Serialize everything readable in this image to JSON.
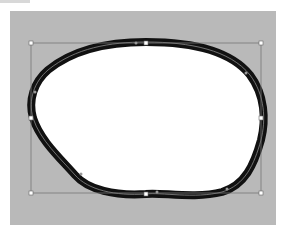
{
  "canvas": {
    "background_color": "#b9b9b9",
    "artboard": "vector-shape-editor"
  },
  "shape": {
    "type": "closed-blob-path",
    "fill": "#ffffff",
    "stroke": "#111111",
    "stroke_width": 8,
    "selected": true
  },
  "bounding_box": {
    "x": 31,
    "y": 43,
    "width": 230,
    "height": 150,
    "stroke": "#777777",
    "handles": [
      {
        "name": "top-left",
        "x": 31,
        "y": 43
      },
      {
        "name": "top-center",
        "x": 146,
        "y": 43
      },
      {
        "name": "top-right",
        "x": 261,
        "y": 43
      },
      {
        "name": "middle-left",
        "x": 31,
        "y": 118
      },
      {
        "name": "middle-right",
        "x": 261,
        "y": 118
      },
      {
        "name": "bottom-left",
        "x": 31,
        "y": 193
      },
      {
        "name": "bottom-center",
        "x": 146,
        "y": 194
      },
      {
        "name": "bottom-right",
        "x": 261,
        "y": 193
      }
    ]
  },
  "anchor_points": [
    {
      "x": 136,
      "y": 43
    },
    {
      "x": 246,
      "y": 73
    },
    {
      "x": 35,
      "y": 92
    },
    {
      "x": 81,
      "y": 174
    },
    {
      "x": 157,
      "y": 192
    },
    {
      "x": 227,
      "y": 189
    }
  ],
  "caption": ""
}
